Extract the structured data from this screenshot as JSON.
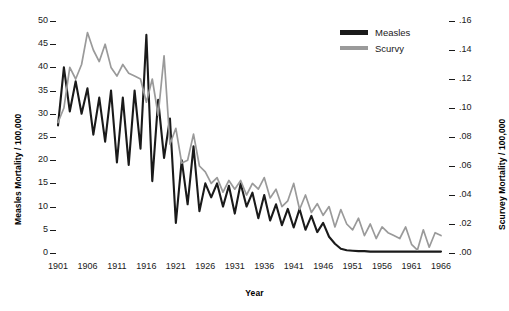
{
  "chart_data": {
    "type": "line",
    "title": "",
    "xlabel": "Year",
    "ylabel": "Measles Mortality / 100,000",
    "y2label": "Scurvey Mortality / 100,000",
    "grid": false,
    "legend_position": "top-right",
    "xlim": [
      1901,
      1966
    ],
    "ylim": [
      0,
      50
    ],
    "y2lim": [
      0.0,
      0.16
    ],
    "x_ticks": [
      "1901",
      "1906",
      "1911",
      "1916",
      "1921",
      "1926",
      "1931",
      "1936",
      "1941",
      "1946",
      "1951",
      "1956",
      "1961",
      "1966"
    ],
    "y_ticks_left": [
      "0",
      "5",
      "10",
      "15",
      "20",
      "25",
      "30",
      "35",
      "40",
      "45",
      "50"
    ],
    "y_ticks_right": [
      ".00",
      ".02",
      ".04",
      ".06",
      ".08",
      ".10",
      ".12",
      ".14",
      ".16"
    ],
    "x": [
      1901,
      1902,
      1903,
      1904,
      1905,
      1906,
      1907,
      1908,
      1909,
      1910,
      1911,
      1912,
      1913,
      1914,
      1915,
      1916,
      1917,
      1918,
      1919,
      1920,
      1921,
      1922,
      1923,
      1924,
      1925,
      1926,
      1927,
      1928,
      1929,
      1930,
      1931,
      1932,
      1933,
      1934,
      1935,
      1936,
      1937,
      1938,
      1939,
      1940,
      1941,
      1942,
      1943,
      1944,
      1945,
      1946,
      1947,
      1948,
      1949,
      1950,
      1951,
      1952,
      1953,
      1954,
      1955,
      1956,
      1957,
      1958,
      1959,
      1960,
      1961,
      1962,
      1963,
      1964,
      1965,
      1966
    ],
    "series": [
      {
        "name": "Measles",
        "color": "#1a1a1a",
        "axis": "left",
        "values": [
          27.5,
          40.0,
          30.5,
          37.0,
          30.0,
          35.5,
          25.5,
          33.5,
          24.0,
          35.0,
          19.5,
          33.5,
          19.0,
          35.0,
          22.5,
          47.0,
          15.5,
          33.0,
          20.5,
          29.0,
          6.5,
          20.0,
          10.5,
          23.0,
          9.0,
          15.0,
          12.0,
          15.0,
          10.0,
          14.5,
          8.5,
          15.0,
          10.0,
          13.0,
          7.5,
          12.5,
          7.0,
          10.5,
          6.0,
          9.5,
          5.5,
          9.5,
          5.0,
          8.0,
          4.5,
          6.5,
          3.5,
          2.0,
          0.9,
          0.6,
          0.5,
          0.4,
          0.4,
          0.3,
          0.3,
          0.3,
          0.3,
          0.3,
          0.3,
          0.3,
          0.3,
          0.3,
          0.3,
          0.3,
          0.3,
          0.3
        ]
      },
      {
        "name": "Scurvy",
        "color": "#9a9a9a",
        "axis": "right",
        "values": [
          0.09,
          0.1,
          0.128,
          0.12,
          0.13,
          0.152,
          0.14,
          0.132,
          0.144,
          0.128,
          0.122,
          0.13,
          0.124,
          0.122,
          0.12,
          0.104,
          0.12,
          0.095,
          0.136,
          0.075,
          0.086,
          0.062,
          0.064,
          0.082,
          0.06,
          0.056,
          0.048,
          0.052,
          0.042,
          0.05,
          0.044,
          0.05,
          0.04,
          0.048,
          0.044,
          0.052,
          0.038,
          0.044,
          0.032,
          0.036,
          0.048,
          0.03,
          0.04,
          0.028,
          0.034,
          0.026,
          0.032,
          0.018,
          0.03,
          0.02,
          0.016,
          0.024,
          0.012,
          0.02,
          0.01,
          0.018,
          0.014,
          0.012,
          0.01,
          0.018,
          0.006,
          0.002,
          0.016,
          0.004,
          0.014,
          0.012
        ]
      }
    ]
  },
  "legend": {
    "items": [
      {
        "label": "Measles",
        "color": "#1a1a1a"
      },
      {
        "label": "Scurvy",
        "color": "#9a9a9a"
      }
    ]
  },
  "axes": {
    "x_title": "Year",
    "y_left_title": "Measles Mortality / 100,000",
    "y_right_title": "Scurvey Mortality / 100,000"
  }
}
